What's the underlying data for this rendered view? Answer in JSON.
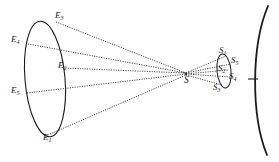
{
  "figure": {
    "type": "optical-ray-diagram",
    "background_color": "#ffffff",
    "stroke_color": "#1a1a1a",
    "ray_style": "dotted",
    "labels": {
      "object_plane": {
        "E3": "E",
        "E3_sub": "3",
        "E4": "E",
        "E4_sub": "4",
        "E2": "E",
        "E2_sub": "2",
        "E5": "E",
        "E5_sub": "5",
        "E1": "E",
        "E1_sub": "1"
      },
      "vertex": {
        "S": "S"
      },
      "image_plane": {
        "S1": "S",
        "S1_sub": "1",
        "S5": "S",
        "S5_sub": "5",
        "S2": "S",
        "S2_sub": "2",
        "S4": "S",
        "S4_sub": "4",
        "S3": "S",
        "S3_sub": "3"
      }
    }
  }
}
